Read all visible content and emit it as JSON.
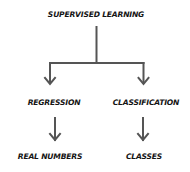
{
  "diagram": {
    "root": {
      "label": "SUPERVISED LEARNING"
    },
    "branches": [
      {
        "label": "REGRESSION",
        "output": "REAL NUMBERS"
      },
      {
        "label": "CLASSIFICATION",
        "output": "CLASSES"
      }
    ],
    "colors": {
      "text": "#141414",
      "lines": "#555555",
      "background": "#ffffff"
    }
  }
}
